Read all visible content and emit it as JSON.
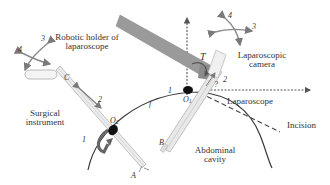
{
  "labels": {
    "robotic_holder_line1": "Robotic holder of",
    "robotic_holder_line2": "laparoscope",
    "laparoscopic_camera_line1": "Laparoscopic",
    "laparoscopic_camera_line2": "camera",
    "surgical_instrument_line1": "Surgical",
    "surgical_instrument_line2": "instrument",
    "laparoscope": "Laparoscope",
    "incision": "Incision",
    "abdominal_cavity_line1": "Abdominal",
    "abdominal_cavity_line2": "cavity"
  },
  "points": {
    "C": "C",
    "A": "A",
    "B": "B",
    "T": "T",
    "f": "f",
    "O": "O",
    "O1_sub": "1",
    "O2_sub": "2"
  },
  "motion_numbers": {
    "left_4": "4",
    "left_3": "3",
    "right_4": "4",
    "right_3": "3",
    "instrument_2": "2",
    "instrument_1": "1",
    "scope_2": "2",
    "scope_q": "?",
    "curve_1": "1"
  },
  "colors": {
    "arrow_gray": "#8a8a8a",
    "holder_gray": "#9a9a9a",
    "line_dark": "#3a3a3a",
    "port_black": "#111111"
  }
}
